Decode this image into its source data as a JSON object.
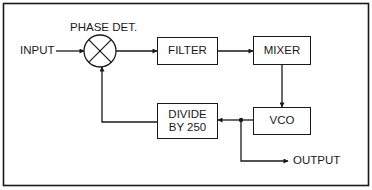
{
  "diagram": {
    "type": "block-diagram",
    "colors": {
      "line": "#1a1a1a",
      "background": "#ffffff"
    },
    "blocks": {
      "phase_detector": {
        "label": "PHASE DET.",
        "symbol": "circle-x"
      },
      "filter": {
        "label": "FILTER"
      },
      "mixer": {
        "label": "MIXER"
      },
      "vco": {
        "label": "VCO"
      },
      "divider": {
        "line1": "DIVIDE",
        "line2": "BY 250"
      }
    },
    "terminals": {
      "input": {
        "label": "INPUT"
      },
      "output": {
        "label": "OUTPUT"
      }
    },
    "connections": [
      {
        "from": "INPUT",
        "to": "PHASE DET."
      },
      {
        "from": "PHASE DET.",
        "to": "FILTER"
      },
      {
        "from": "FILTER",
        "to": "MIXER"
      },
      {
        "from": "MIXER",
        "to": "VCO"
      },
      {
        "from": "VCO",
        "to": "DIVIDE BY 250"
      },
      {
        "from": "VCO",
        "to": "OUTPUT"
      },
      {
        "from": "DIVIDE BY 250",
        "to": "PHASE DET."
      }
    ]
  }
}
